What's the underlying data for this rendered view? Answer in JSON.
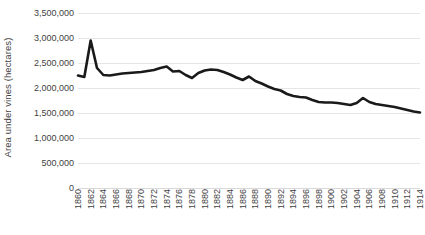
{
  "chart_data": {
    "type": "line",
    "title": "",
    "xlabel": "",
    "ylabel": "Area under vines (hectares)",
    "ylim": [
      0,
      3500000
    ],
    "ytick_values": [
      0,
      500000,
      1000000,
      1500000,
      2000000,
      2500000,
      3000000,
      3500000
    ],
    "ytick_labels": [
      "0",
      "500,000",
      "1,000,000",
      "1,500,000",
      "2,000,000",
      "2,500,000",
      "3,000,000",
      "3,500,000"
    ],
    "xlim": [
      1860,
      1914
    ],
    "xtick_values": [
      1860,
      1862,
      1864,
      1866,
      1868,
      1870,
      1872,
      1874,
      1876,
      1878,
      1880,
      1882,
      1884,
      1886,
      1888,
      1890,
      1892,
      1894,
      1896,
      1898,
      1900,
      1902,
      1904,
      1906,
      1908,
      1910,
      1912,
      1914
    ],
    "xtick_labels": [
      "1860",
      "1862",
      "1864",
      "1866",
      "1868",
      "1870",
      "1872",
      "1874",
      "1876",
      "1878",
      "1880",
      "1882",
      "1884",
      "1886",
      "1888",
      "1890",
      "1892",
      "1894",
      "1896",
      "1898",
      "1900",
      "1902",
      "1904",
      "1906",
      "1908",
      "1910",
      "1912",
      "1914"
    ],
    "grid": true,
    "grid_axis": "y",
    "legend": false,
    "line_color": "#1a1a1a",
    "line_width": 2.6,
    "series": [
      {
        "name": "Area under vines (hectares)",
        "x": [
          1860,
          1861,
          1862,
          1863,
          1864,
          1865,
          1866,
          1867,
          1868,
          1869,
          1870,
          1871,
          1872,
          1873,
          1874,
          1875,
          1876,
          1877,
          1878,
          1879,
          1880,
          1881,
          1882,
          1883,
          1884,
          1885,
          1886,
          1887,
          1888,
          1889,
          1890,
          1891,
          1892,
          1893,
          1894,
          1895,
          1896,
          1897,
          1898,
          1899,
          1900,
          1901,
          1902,
          1903,
          1904,
          1905,
          1906,
          1907,
          1908,
          1909,
          1910,
          1911,
          1912,
          1913,
          1914
        ],
        "values": [
          2250000,
          2220000,
          2950000,
          2400000,
          2260000,
          2250000,
          2270000,
          2290000,
          2300000,
          2310000,
          2320000,
          2340000,
          2360000,
          2400000,
          2430000,
          2330000,
          2340000,
          2260000,
          2200000,
          2300000,
          2350000,
          2370000,
          2360000,
          2320000,
          2270000,
          2210000,
          2160000,
          2230000,
          2140000,
          2090000,
          2030000,
          1980000,
          1950000,
          1880000,
          1840000,
          1820000,
          1810000,
          1760000,
          1720000,
          1710000,
          1710000,
          1700000,
          1680000,
          1660000,
          1700000,
          1800000,
          1720000,
          1680000,
          1660000,
          1640000,
          1620000,
          1590000,
          1560000,
          1530000,
          1510000
        ]
      }
    ]
  }
}
